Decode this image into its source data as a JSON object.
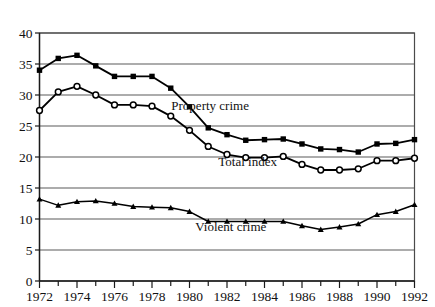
{
  "chart_data": {
    "type": "line",
    "title": "",
    "subtitle": "",
    "xlabel": "",
    "ylabel": "",
    "xlim": [
      1972,
      1992
    ],
    "ylim": [
      0,
      40
    ],
    "grid": true,
    "legend_position": "inline-annotations",
    "y_ticks": [
      0,
      5,
      10,
      15,
      20,
      25,
      30,
      35,
      40
    ],
    "y_tick_labels": [
      "0",
      "5",
      "10",
      "15",
      "20",
      "25",
      "30",
      "35",
      "40"
    ],
    "x_ticks": [
      1972,
      1973,
      1974,
      1975,
      1976,
      1977,
      1978,
      1979,
      1980,
      1981,
      1982,
      1983,
      1984,
      1985,
      1986,
      1987,
      1988,
      1989,
      1990,
      1991,
      1992
    ],
    "x_tick_labels": [
      "1972",
      "",
      "1974",
      "",
      "1976",
      "",
      "1978",
      "",
      "1980",
      "",
      "1982",
      "",
      "1984",
      "",
      "1986",
      "",
      "1988",
      "",
      "1990",
      "",
      "1992"
    ],
    "x": [
      1972,
      1973,
      1974,
      1975,
      1976,
      1977,
      1978,
      1979,
      1980,
      1981,
      1982,
      1983,
      1984,
      1985,
      1986,
      1987,
      1988,
      1989,
      1990,
      1991,
      1992
    ],
    "series": [
      {
        "name": "Property crime",
        "marker": "filled-square",
        "label_x": 1981.1,
        "label_y": 27.6,
        "values": [
          34.0,
          35.9,
          36.4,
          34.7,
          33.0,
          33.0,
          33.0,
          31.1,
          28.1,
          24.7,
          23.6,
          22.7,
          22.8,
          22.9,
          22.1,
          21.3,
          21.2,
          20.8,
          22.1,
          22.2,
          22.8
        ]
      },
      {
        "name": "Total index",
        "marker": "open-circle",
        "label_x": 1983.1,
        "label_y": 18.6,
        "values": [
          27.5,
          30.5,
          31.4,
          30.0,
          28.4,
          28.4,
          28.2,
          26.6,
          24.3,
          21.7,
          20.4,
          19.9,
          19.9,
          20.1,
          18.8,
          17.9,
          17.9,
          18.1,
          19.4,
          19.4,
          19.8
        ]
      },
      {
        "name": "Violent crime",
        "marker": "filled-triangle",
        "label_x": 1982.2,
        "label_y": 8.0,
        "values": [
          13.2,
          12.2,
          12.8,
          12.9,
          12.5,
          12.0,
          11.9,
          11.8,
          11.2,
          9.6,
          9.6,
          9.6,
          9.6,
          9.6,
          8.9,
          8.3,
          8.7,
          9.2,
          10.7,
          11.2,
          12.3
        ]
      }
    ]
  },
  "figure": {
    "background_color": "#ffffff",
    "line_color": "#000000",
    "grid_color": "#5a5a5a"
  }
}
